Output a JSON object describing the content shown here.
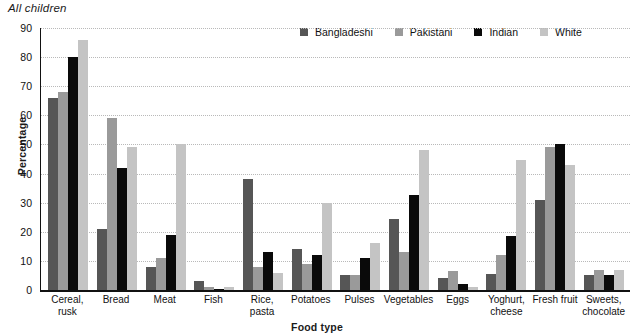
{
  "chart_data": {
    "type": "bar",
    "title": "All children",
    "xlabel": "Food type",
    "ylabel": "Percentage",
    "ylim": [
      0,
      90
    ],
    "yticks": [
      0,
      10,
      20,
      30,
      40,
      50,
      60,
      70,
      80,
      90
    ],
    "grid": true,
    "legend_position": "top-right",
    "categories": [
      "Cereal, rusk",
      "Bread",
      "Meat",
      "Fish",
      "Rice, pasta",
      "Potatoes",
      "Pulses",
      "Vegetables",
      "Eggs",
      "Yoghurt, cheese",
      "Fresh fruit",
      "Sweets, chocolate"
    ],
    "category_lines": [
      [
        "Cereal,",
        "rusk"
      ],
      [
        "Bread"
      ],
      [
        "Meat"
      ],
      [
        "Fish"
      ],
      [
        "Rice,",
        "pasta"
      ],
      [
        "Potatoes"
      ],
      [
        "Pulses"
      ],
      [
        "Vegetables"
      ],
      [
        "Eggs"
      ],
      [
        "Yoghurt,",
        "cheese"
      ],
      [
        "Fresh fruit"
      ],
      [
        "Sweets,",
        "chocolate"
      ]
    ],
    "series": [
      {
        "name": "Bangladeshi",
        "color": "#565656",
        "values": [
          66,
          21,
          8,
          3,
          38,
          14,
          5,
          24.5,
          4,
          5.5,
          31,
          5
        ]
      },
      {
        "name": "Pakistani",
        "color": "#9a9a9a",
        "values": [
          68,
          59,
          11,
          1,
          8,
          9,
          5,
          13,
          6.5,
          12,
          49,
          7
        ]
      },
      {
        "name": "Indian",
        "color": "#0a0a0a",
        "values": [
          80,
          42,
          19,
          0.5,
          13,
          12,
          11,
          32.5,
          2,
          18.5,
          50,
          5
        ]
      },
      {
        "name": "White",
        "color": "#c4c4c4",
        "values": [
          86,
          49,
          50,
          1,
          6,
          30,
          16,
          48,
          1,
          44.5,
          43,
          7
        ]
      }
    ]
  }
}
